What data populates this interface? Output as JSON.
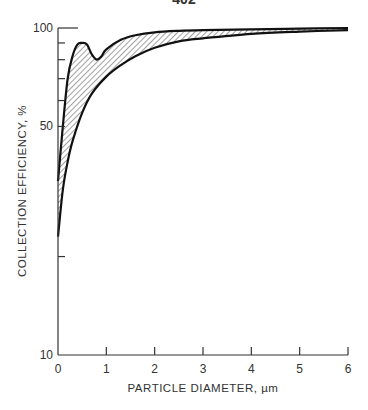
{
  "page_number": "402",
  "chart_data": {
    "type": "area",
    "title": "",
    "xlabel": "PARTICLE DIAMETER, µm",
    "ylabel": "COLLECTION EFFICIENCY, %",
    "xlim": [
      0,
      6
    ],
    "ylim": [
      10,
      100
    ],
    "yscale": "log",
    "x_ticks": [
      "0",
      "1",
      "2",
      "3",
      "4",
      "5",
      "6"
    ],
    "y_tick_labels": [
      "10",
      "50",
      "100"
    ],
    "y_minor_ticks": [
      20,
      60,
      70,
      80,
      90
    ],
    "grid": false,
    "legend": null,
    "series": [
      {
        "name": "upper bound",
        "x": [
          0,
          0.1,
          0.2,
          0.3,
          0.4,
          0.5,
          0.6,
          0.7,
          0.8,
          0.9,
          1.0,
          1.3,
          1.6,
          2.0,
          2.5,
          3.0,
          4.0,
          5.0,
          6.0
        ],
        "values": [
          34,
          50,
          70,
          82,
          89,
          90,
          89,
          83,
          80,
          82,
          86,
          92,
          95,
          97,
          98,
          98.5,
          99,
          99.5,
          100
        ]
      },
      {
        "name": "lower bound",
        "x": [
          0,
          0.1,
          0.2,
          0.3,
          0.5,
          0.7,
          1.0,
          1.3,
          1.6,
          2.0,
          2.5,
          3.0,
          4.0,
          5.0,
          6.0
        ],
        "values": [
          23,
          32,
          39,
          45,
          55,
          63,
          71,
          77,
          82,
          87,
          91,
          93,
          96,
          97.5,
          98.5
        ]
      }
    ],
    "fill_between": "hatched region between upper and lower bound"
  }
}
